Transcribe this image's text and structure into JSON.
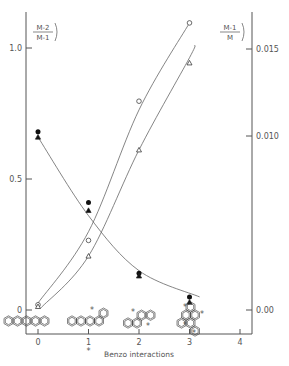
{
  "chart_data": {
    "type": "scatter",
    "title": "",
    "xlabel": "Benzo interactions",
    "ylabel_left": "(M-2)/(M-1)",
    "ylabel_right": "(M-1)/M",
    "xlim": [
      -0.2,
      4.2
    ],
    "ylim_left": [
      -0.1,
      1.1
    ],
    "ylim_right": [
      -0.0015,
      0.0165
    ],
    "x_ticks": [
      "0",
      "1",
      "2",
      "3",
      "4"
    ],
    "y_ticks_left": [
      "0",
      "0.5",
      "1.0"
    ],
    "y_ticks_right": [
      "0.00",
      "0.010",
      "0.015"
    ],
    "grid": false,
    "legend": "none",
    "series": [
      {
        "name": "(M-2)/(M-1) filled circles",
        "axis": "left",
        "marker": "filled-circle",
        "x": [
          0,
          1,
          2,
          3
        ],
        "values": [
          0.68,
          0.41,
          0.14,
          0.05
        ]
      },
      {
        "name": "(M-2)/(M-1) filled triangles",
        "axis": "left",
        "marker": "filled-triangle",
        "x": [
          0,
          1,
          2,
          3
        ],
        "values": [
          0.66,
          0.38,
          0.13,
          0.03
        ]
      },
      {
        "name": "(M-1)/M open circles",
        "axis": "right",
        "marker": "open-circle",
        "x": [
          0,
          1,
          2,
          3
        ],
        "values": [
          0.0003,
          0.004,
          0.012,
          0.0165
        ]
      },
      {
        "name": "(M-1)/M open triangles",
        "axis": "right",
        "marker": "open-triangle",
        "x": [
          0,
          1,
          2,
          3
        ],
        "values": [
          0.0002,
          0.0031,
          0.0092,
          0.0142
        ]
      }
    ],
    "annotations": [
      "polycyclic aromatic structures drawn below x=0,1,2,3",
      "asterisk below x-tick 1"
    ]
  },
  "labels": {
    "xlabel": "Benzo interactions",
    "left_num": "M-2",
    "left_den": "M-1",
    "right_num": "M-1",
    "right_den": "M",
    "star": "*"
  }
}
